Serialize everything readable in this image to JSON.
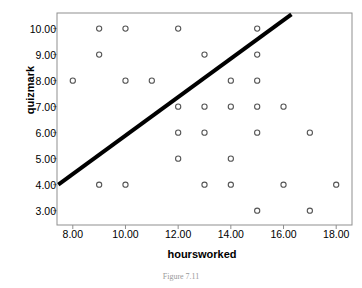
{
  "chart_data": {
    "type": "scatter",
    "title": "",
    "xlabel": "hoursworked",
    "ylabel": "quizmark",
    "xlim": [
      7.4,
      18.6
    ],
    "ylim": [
      2.45,
      10.6
    ],
    "xticks": [
      "8.00",
      "10.00",
      "12.00",
      "14.00",
      "16.00",
      "18.00"
    ],
    "xtick_values": [
      8,
      10,
      12,
      14,
      16,
      18
    ],
    "yticks": [
      "3.00",
      "4.00",
      "5.00",
      "6.00",
      "7.00",
      "8.00",
      "9.00",
      "10.00"
    ],
    "ytick_values": [
      3,
      4,
      5,
      6,
      7,
      8,
      9,
      10
    ],
    "grid": false,
    "legend": null,
    "marker": "open-circle",
    "marker_color": "#555555",
    "points": [
      {
        "x": 9,
        "y": 10
      },
      {
        "x": 10,
        "y": 10
      },
      {
        "x": 12,
        "y": 10
      },
      {
        "x": 15,
        "y": 10
      },
      {
        "x": 9,
        "y": 9
      },
      {
        "x": 13,
        "y": 9
      },
      {
        "x": 15,
        "y": 9
      },
      {
        "x": 8,
        "y": 8
      },
      {
        "x": 10,
        "y": 8
      },
      {
        "x": 11,
        "y": 8
      },
      {
        "x": 14,
        "y": 8
      },
      {
        "x": 15,
        "y": 8
      },
      {
        "x": 12,
        "y": 7
      },
      {
        "x": 13,
        "y": 7
      },
      {
        "x": 14,
        "y": 7
      },
      {
        "x": 15,
        "y": 7
      },
      {
        "x": 16,
        "y": 7
      },
      {
        "x": 12,
        "y": 6
      },
      {
        "x": 13,
        "y": 6
      },
      {
        "x": 15,
        "y": 6
      },
      {
        "x": 17,
        "y": 6
      },
      {
        "x": 12,
        "y": 5
      },
      {
        "x": 14,
        "y": 5
      },
      {
        "x": 9,
        "y": 4
      },
      {
        "x": 10,
        "y": 4
      },
      {
        "x": 13,
        "y": 4
      },
      {
        "x": 14,
        "y": 4
      },
      {
        "x": 16,
        "y": 4
      },
      {
        "x": 18,
        "y": 4
      },
      {
        "x": 15,
        "y": 3
      },
      {
        "x": 17,
        "y": 3
      }
    ],
    "fit_line": {
      "x_start": 7.45,
      "y_start": 4.0,
      "x_end": 16.3,
      "y_end": 10.55,
      "color": "#000000",
      "width": 4
    },
    "caption": "Figure 7.11"
  }
}
